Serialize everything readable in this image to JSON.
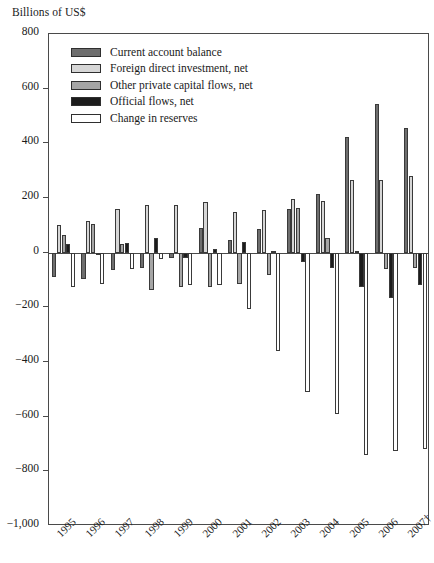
{
  "chart_data": {
    "type": "bar",
    "title": "",
    "ylabel": "Billions of US$",
    "xlabel": "",
    "ylim": [
      -1000,
      800
    ],
    "ytick_labels": [
      "800",
      "600",
      "400",
      "200",
      "0",
      "−200",
      "−400",
      "−600",
      "−800",
      "−1,000"
    ],
    "ytick_values": [
      800,
      600,
      400,
      200,
      0,
      -200,
      -400,
      -600,
      -800,
      -1000
    ],
    "grid": false,
    "legend_position": "top-left",
    "categories": [
      "1995",
      "1996",
      "1997",
      "1998",
      "1999",
      "2000",
      "2001",
      "2002",
      "2003",
      "2004",
      "2005",
      "2006",
      "2007†"
    ],
    "series": [
      {
        "name": "Current account balance",
        "color": "#6e6e6e",
        "values": [
          -90,
          -95,
          -65,
          -55,
          -20,
          90,
          45,
          85,
          160,
          215,
          425,
          545,
          455
        ]
      },
      {
        "name": "Foreign direct investment, net",
        "color": "#d6d6d6",
        "values": [
          100,
          115,
          160,
          175,
          175,
          185,
          150,
          155,
          195,
          190,
          265,
          265,
          280
        ]
      },
      {
        "name": "Other private capital flows, net",
        "color": "#a5a5a5",
        "values": [
          65,
          105,
          30,
          -135,
          -125,
          -125,
          -115,
          -80,
          165,
          55,
          5,
          -60,
          -55
        ]
      },
      {
        "name": "Official flows, net",
        "color": "#1c1c1c",
        "values": [
          30,
          -5,
          35,
          55,
          -20,
          15,
          40,
          5,
          -35,
          -55,
          -125,
          -165,
          -120
        ]
      },
      {
        "name": "Change in reserves",
        "color": "#ffffff",
        "values": [
          -125,
          -115,
          -60,
          -25,
          -120,
          -120,
          -205,
          -360,
          -510,
          -590,
          -740,
          -725,
          -720
        ]
      }
    ]
  },
  "legend": {
    "items": [
      {
        "label": "Current account balance",
        "swatch": "#6e6e6e"
      },
      {
        "label": "Foreign direct investment, net",
        "swatch": "#d6d6d6"
      },
      {
        "label": "Other private capital flows, net",
        "swatch": "#a5a5a5"
      },
      {
        "label": "Official flows, net",
        "swatch": "#1c1c1c"
      },
      {
        "label": "Change in reserves",
        "swatch": "#ffffff"
      }
    ]
  }
}
